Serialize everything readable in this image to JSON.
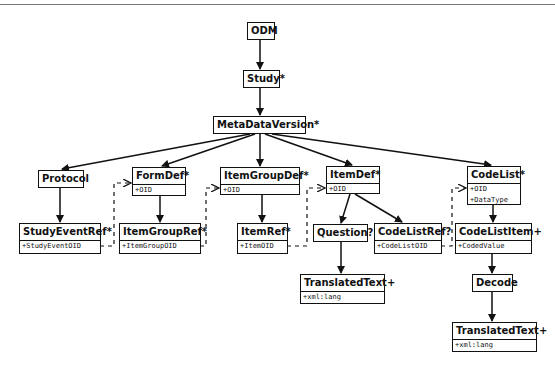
{
  "diagram": {
    "nodes": {
      "odm": {
        "title": "ODM"
      },
      "study": {
        "title": "Study*"
      },
      "metadataversion": {
        "title": "MetaDataVersion*"
      },
      "protocol": {
        "title": "Protocol"
      },
      "formdef": {
        "title": "FormDef*",
        "attrs": [
          "+OID"
        ]
      },
      "itemgroupdef": {
        "title": "ItemGroupDef*",
        "attrs": [
          "+OID"
        ]
      },
      "itemdef": {
        "title": "ItemDef*",
        "attrs": [
          "+OID"
        ]
      },
      "codelist": {
        "title": "CodeList*",
        "attrs": [
          "+OID",
          "+DataType"
        ]
      },
      "studyeventref": {
        "title": "StudyEventRef*",
        "attrs": [
          "+StudyEventOID"
        ]
      },
      "itemgroupref": {
        "title": "ItemGroupRef*",
        "attrs": [
          "+ItemGroupOID"
        ]
      },
      "itemref": {
        "title": "ItemRef*",
        "attrs": [
          "+ItemOID"
        ]
      },
      "question": {
        "title": "Question?"
      },
      "codelistref": {
        "title": "CodeListRef?",
        "attrs": [
          "+CodeListOID"
        ]
      },
      "codelistitem": {
        "title": "CodeListItem+",
        "attrs": [
          "+CodedValue"
        ]
      },
      "translatedtext_question": {
        "title": "TranslatedText+",
        "attrs": [
          "+xml:lang"
        ]
      },
      "decode": {
        "title": "Decode"
      },
      "translatedtext_decode": {
        "title": "TranslatedText+",
        "attrs": [
          "+xml:lang"
        ]
      }
    },
    "edges": [
      {
        "from": "ODM",
        "to": "Study*",
        "style": "solid"
      },
      {
        "from": "Study*",
        "to": "MetaDataVersion*",
        "style": "solid"
      },
      {
        "from": "MetaDataVersion*",
        "to": "Protocol",
        "style": "solid"
      },
      {
        "from": "MetaDataVersion*",
        "to": "FormDef*",
        "style": "solid"
      },
      {
        "from": "MetaDataVersion*",
        "to": "ItemGroupDef*",
        "style": "solid"
      },
      {
        "from": "MetaDataVersion*",
        "to": "ItemDef*",
        "style": "solid"
      },
      {
        "from": "MetaDataVersion*",
        "to": "CodeList*",
        "style": "solid"
      },
      {
        "from": "Protocol",
        "to": "StudyEventRef*",
        "style": "solid"
      },
      {
        "from": "FormDef*",
        "to": "ItemGroupRef*",
        "style": "solid"
      },
      {
        "from": "ItemGroupDef*",
        "to": "ItemRef*",
        "style": "solid"
      },
      {
        "from": "ItemDef*",
        "to": "Question?",
        "style": "solid"
      },
      {
        "from": "ItemDef*",
        "to": "CodeListRef?",
        "style": "solid"
      },
      {
        "from": "Question?",
        "to": "TranslatedText+",
        "style": "solid"
      },
      {
        "from": "CodeList*",
        "to": "CodeListItem+",
        "style": "solid"
      },
      {
        "from": "CodeListItem+",
        "to": "Decode",
        "style": "solid"
      },
      {
        "from": "Decode",
        "to": "TranslatedText+",
        "style": "solid"
      },
      {
        "from": "StudyEventRef*",
        "to": "FormDef*",
        "style": "dashed"
      },
      {
        "from": "ItemGroupRef*",
        "to": "ItemGroupDef*",
        "style": "dashed"
      },
      {
        "from": "ItemRef*",
        "to": "ItemDef*",
        "style": "dashed"
      },
      {
        "from": "CodeListRef?",
        "to": "CodeList*",
        "style": "dashed"
      }
    ],
    "colors": {
      "line": "#111111",
      "background": "#ffffff"
    }
  }
}
